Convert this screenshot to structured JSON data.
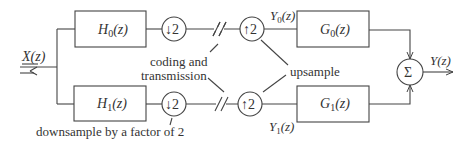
{
  "diagram": {
    "input_label": "X(z)",
    "output_label": "Y(z)",
    "branches": [
      {
        "analysis_filter": "H0(z)",
        "down": "2",
        "up": "2",
        "mid_signal": "Y0(z)",
        "synthesis_filter": "G0(z)"
      },
      {
        "analysis_filter": "H1(z)",
        "down": "2",
        "up": "2",
        "mid_signal": "Y1(z)",
        "synthesis_filter": "G1(z)"
      }
    ],
    "summer_symbol": "Σ",
    "annotations": {
      "coding_line1": "coding and",
      "coding_line2": "transmission",
      "upsample": "upsample",
      "downsample": "downsample by a factor of 2"
    },
    "text": {
      "H0_main": "H",
      "H0_sub": "0",
      "H0_arg": "(z)",
      "H1_main": "H",
      "H1_sub": "1",
      "H1_arg": "(z)",
      "G0_main": "G",
      "G0_sub": "0",
      "G0_arg": "(z)",
      "G1_main": "G",
      "G1_sub": "1",
      "G1_arg": "(z)",
      "Y0_main": "Y",
      "Y0_sub": "0",
      "Y0_arg": "(z)",
      "Y1_main": "Y",
      "Y1_sub": "1",
      "Y1_arg": "(z)",
      "down_arrow": "↓",
      "up_arrow": "↑",
      "factor": "2"
    }
  }
}
